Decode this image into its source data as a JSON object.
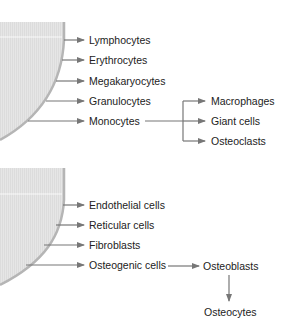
{
  "colors": {
    "marrow_fill": "#e4e4e4",
    "marrow_edge": "#b8b8b8",
    "arrow": "#777777",
    "text": "#222222"
  },
  "hematopoietic": {
    "items": [
      {
        "label": "Lymphocytes"
      },
      {
        "label": "Erythrocytes"
      },
      {
        "label": "Megakaryocytes"
      },
      {
        "label": "Granulocytes"
      },
      {
        "label": "Monocytes"
      }
    ],
    "monocyte_derivatives": [
      {
        "label": "Macrophages"
      },
      {
        "label": "Giant cells"
      },
      {
        "label": "Osteoclasts"
      }
    ]
  },
  "stromal": {
    "items": [
      {
        "label": "Endothelial cells"
      },
      {
        "label": "Reticular cells"
      },
      {
        "label": "Fibroblasts"
      },
      {
        "label": "Osteogenic cells"
      }
    ],
    "osteogenic_path": [
      {
        "label": "Osteoblasts"
      },
      {
        "label": "Osteocytes"
      }
    ]
  }
}
